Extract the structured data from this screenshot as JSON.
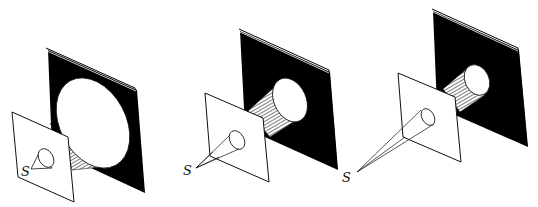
{
  "figure": {
    "panels": [
      {
        "id": 1,
        "source_label": "S",
        "source_distance": "near",
        "spot_size": "large"
      },
      {
        "id": 2,
        "source_label": "S",
        "source_distance": "medium",
        "spot_size": "medium"
      },
      {
        "id": 3,
        "source_label": "S",
        "source_distance": "far",
        "spot_size": "small"
      }
    ],
    "colors": {
      "screen": "#000000",
      "plate": "#ffffff",
      "line": "#111111",
      "background": "#ffffff"
    }
  }
}
